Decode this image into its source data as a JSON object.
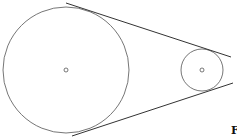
{
  "diagram": {
    "type": "belt-and-pulley",
    "large_pulley": {
      "cx": 66,
      "cy": 70,
      "r": 63
    },
    "small_pulley": {
      "cx": 202,
      "cy": 70,
      "r": 21
    },
    "label": "F"
  }
}
